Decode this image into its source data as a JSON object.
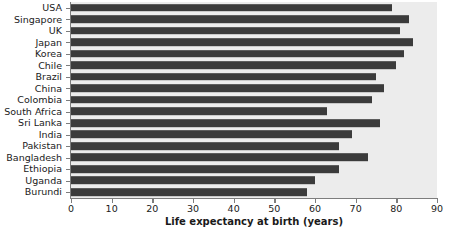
{
  "chart_data": {
    "type": "bar",
    "orientation": "horizontal",
    "title": "",
    "xlabel": "Life expectancy at birth (years)",
    "ylabel": "",
    "xlim": [
      0,
      90
    ],
    "xticks": [
      0,
      10,
      20,
      30,
      40,
      50,
      60,
      70,
      80,
      90
    ],
    "grid": false,
    "legend": null,
    "categories": [
      "USA",
      "Singapore",
      "UK",
      "Japan",
      "Korea",
      "Chile",
      "Brazil",
      "China",
      "Colombia",
      "South Africa",
      "Sri Lanka",
      "India",
      "Pakistan",
      "Bangladesh",
      "Ethiopia",
      "Uganda",
      "Burundi"
    ],
    "values": [
      79,
      83,
      81,
      84,
      82,
      80,
      75,
      77,
      74,
      63,
      76,
      69,
      66,
      73,
      66,
      60,
      58
    ],
    "bar_color": "#3b3b3b",
    "plot_background": "#ececec",
    "axis_color": "#7d7d7d"
  }
}
